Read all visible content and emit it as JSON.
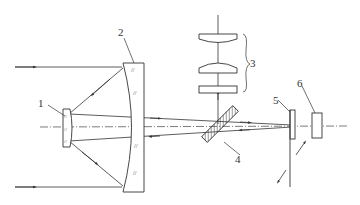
{
  "diagram": {
    "type": "optical-system",
    "labels": {
      "l1": "1",
      "l2": "2",
      "l3": "3",
      "l4": "4",
      "l5": "5",
      "l6": "6"
    },
    "components": [
      {
        "id": "1",
        "desc": "secondary mirror / small lens"
      },
      {
        "id": "2",
        "desc": "primary concave mirror"
      },
      {
        "id": "3",
        "desc": "lens group"
      },
      {
        "id": "4",
        "desc": "beam splitter"
      },
      {
        "id": "5",
        "desc": "reticle / focal plane element"
      },
      {
        "id": "6",
        "desc": "detector"
      }
    ],
    "colors": {
      "stroke": "#333333",
      "background": "#ffffff"
    }
  }
}
